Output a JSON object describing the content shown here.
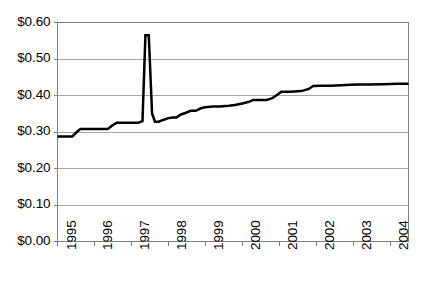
{
  "chart_data": {
    "type": "line",
    "title": "",
    "subtitle": "",
    "xlabel": "",
    "ylabel": "",
    "legend": [],
    "legend_position": "none",
    "grid": true,
    "grid_axis": "y",
    "xlim": [
      1995,
      2004.5
    ],
    "ylim": [
      0.0,
      0.6
    ],
    "y_tick_values": [
      0.0,
      0.1,
      0.2,
      0.3,
      0.4,
      0.5,
      0.6
    ],
    "y_tick_labels": [
      "$0.00",
      "$0.10",
      "$0.20",
      "$0.30",
      "$0.40",
      "$0.50",
      "$0.60"
    ],
    "x_tick_values": [
      1995,
      1996,
      1997,
      1998,
      1999,
      2000,
      2001,
      2002,
      2003,
      2004
    ],
    "x_tick_labels": [
      "1995",
      "1996",
      "1997",
      "1998",
      "1999",
      "2000",
      "2001",
      "2002",
      "2003",
      "2004"
    ],
    "x_tick_rotation": 90,
    "currency_prefix": "$",
    "line_color": "#000000",
    "line_width": 2.5,
    "grid_color": "#a6a6a6",
    "axis_color": "#808080",
    "plot_background": "#ffffff",
    "series": [
      {
        "name": "price",
        "x": [
          1995.0,
          1995.4,
          1995.52,
          1995.62,
          1996.0,
          1996.36,
          1996.48,
          1996.6,
          1997.0,
          1997.18,
          1997.3,
          1997.38,
          1997.47,
          1997.56,
          1997.64,
          1997.74,
          1997.86,
          1998.0,
          1998.12,
          1998.22,
          1998.34,
          1998.46,
          1998.6,
          1998.74,
          1998.88,
          1999.0,
          1999.2,
          1999.4,
          1999.64,
          1999.8,
          2000.0,
          2000.16,
          2000.3,
          2000.5,
          2000.66,
          2000.8,
          2000.92,
          2001.06,
          2001.3,
          2001.6,
          2001.8,
          2001.92,
          2002.1,
          2002.4,
          2002.8,
          2003.1,
          2003.4,
          2003.8,
          2004.2,
          2004.5
        ],
        "y": [
          0.288,
          0.288,
          0.3,
          0.308,
          0.308,
          0.308,
          0.318,
          0.325,
          0.325,
          0.325,
          0.33,
          0.565,
          0.565,
          0.35,
          0.328,
          0.328,
          0.333,
          0.338,
          0.34,
          0.34,
          0.348,
          0.352,
          0.358,
          0.358,
          0.365,
          0.368,
          0.37,
          0.37,
          0.372,
          0.374,
          0.378,
          0.382,
          0.388,
          0.388,
          0.388,
          0.392,
          0.4,
          0.41,
          0.41,
          0.412,
          0.418,
          0.426,
          0.427,
          0.427,
          0.429,
          0.43,
          0.43,
          0.431,
          0.432,
          0.432
        ]
      }
    ]
  },
  "axis": {
    "y_labels": [
      "$0.60",
      "$0.50",
      "$0.40",
      "$0.30",
      "$0.20",
      "$0.10",
      "$0.00"
    ],
    "x_labels": [
      "1995",
      "1996",
      "1997",
      "1998",
      "1999",
      "2000",
      "2001",
      "2002",
      "2003",
      "2004"
    ]
  }
}
